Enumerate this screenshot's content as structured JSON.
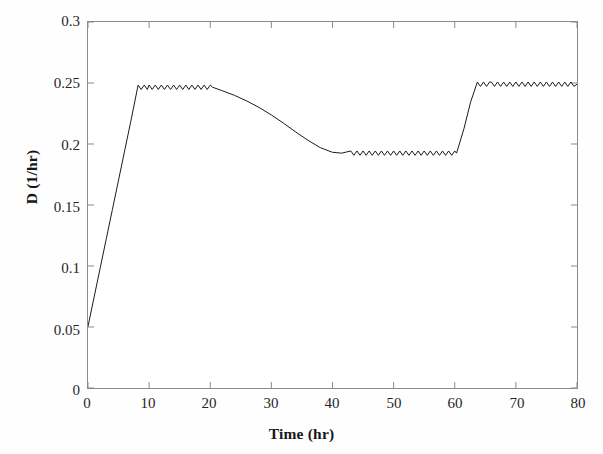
{
  "chart_data": {
    "type": "line",
    "title": "",
    "subtitle": "",
    "xlabel": "Time (hr)",
    "ylabel": "D (1/hr)",
    "xlim": [
      0,
      80
    ],
    "ylim": [
      0,
      0.3
    ],
    "xticks": [
      "0",
      "10",
      "20",
      "30",
      "40",
      "50",
      "60",
      "70",
      "80"
    ],
    "xtick_values": [
      0,
      10,
      20,
      30,
      40,
      50,
      60,
      70,
      80
    ],
    "yticks": [
      "0",
      "0.05",
      "0.1",
      "0.15",
      "0.2",
      "0.25",
      "0.3"
    ],
    "ytick_values": [
      0,
      0.05,
      0.1,
      0.15,
      0.2,
      0.25,
      0.3
    ],
    "grid": false,
    "legend": "none",
    "frame": "box",
    "tick_direction": "in",
    "series": [
      {
        "name": "D",
        "color": "#1a1a1a",
        "linewidth": 1,
        "marker": "none",
        "ripple_amplitude": 0.0018,
        "ripple_period_hr": 1.0,
        "ripple_segments": [
          [
            8.2,
            20.4
          ],
          [
            43.0,
            60.3
          ],
          [
            63.7,
            80.0
          ]
        ],
        "x": [
          0,
          1,
          2,
          3,
          4,
          5,
          6,
          7,
          8.2,
          10,
          12,
          14,
          16,
          18,
          20.4,
          22,
          24,
          26,
          28,
          30,
          32,
          34,
          36,
          38,
          40,
          41.5,
          43,
          46,
          50,
          54,
          58,
          60.3,
          61.5,
          62.6,
          63.7,
          66,
          70,
          74,
          78,
          80
        ],
        "y": [
          0.0505,
          0.0745,
          0.0985,
          0.1225,
          0.1465,
          0.1705,
          0.1945,
          0.2185,
          0.2465,
          0.2465,
          0.2465,
          0.2465,
          0.2465,
          0.2465,
          0.2465,
          0.2436,
          0.2398,
          0.2352,
          0.2299,
          0.2238,
          0.217,
          0.2098,
          0.203,
          0.197,
          0.1932,
          0.1925,
          0.1925,
          0.1925,
          0.1925,
          0.1925,
          0.1925,
          0.1925,
          0.2125,
          0.2345,
          0.249,
          0.249,
          0.249,
          0.249,
          0.249,
          0.249
        ]
      }
    ],
    "annotations": [
      {
        "label": "initial-value",
        "x": 0,
        "y": 0.0505
      },
      {
        "label": "first-plateau",
        "x_range": [
          8.2,
          20.4
        ],
        "y": 0.2465
      },
      {
        "label": "second-plateau",
        "x_range": [
          43.0,
          60.3
        ],
        "y": 0.1925
      },
      {
        "label": "third-plateau",
        "x_range": [
          63.7,
          80.0
        ],
        "y": 0.249
      }
    ]
  },
  "figure": {
    "background": "#ffffff",
    "axis_color": "#8a8a8a",
    "text_color": "#262626",
    "caption_fragment": ""
  }
}
